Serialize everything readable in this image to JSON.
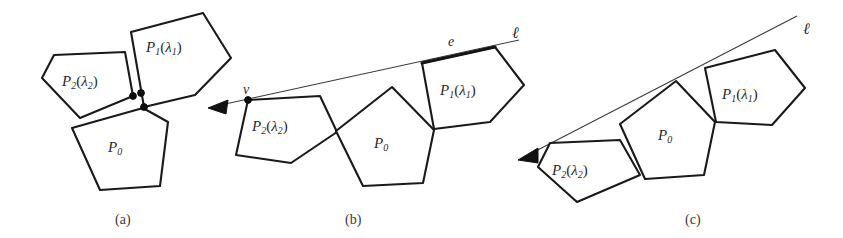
{
  "figure": {
    "width": 843,
    "height": 238,
    "background": "#ffffff",
    "ink_color": "#1a1a1a",
    "line_color": "#3a3a3a",
    "panels": [
      {
        "id": "a",
        "caption": "(a)",
        "caption_pos": [
          115,
          212
        ],
        "has_line": false,
        "polygons": [
          {
            "name": "P2",
            "label": "P",
            "label_sub": "2",
            "label_arg": "λ",
            "label_arg_sub": "2",
            "label_pos": [
              62,
              74
            ],
            "points": "54,55 125,52 133,96 80,118 42,78"
          },
          {
            "name": "P1",
            "label": "P",
            "label_sub": "1",
            "label_arg": "λ",
            "label_arg_sub": "1",
            "label_pos": [
              146,
              40
            ],
            "points": "131,32 203,13 231,58 195,95 144,107"
          },
          {
            "name": "P0",
            "label": "P",
            "label_sub": "0",
            "label_arg": "",
            "label_arg_sub": "",
            "label_pos": [
              108,
              140
            ],
            "points": "143,108 168,122 160,186 100,190 72,128"
          }
        ],
        "dots": [
          [
            133,
            96
          ],
          [
            141,
            93
          ],
          [
            144,
            107
          ]
        ]
      },
      {
        "id": "b",
        "caption": "(b)",
        "caption_pos": [
          345,
          212
        ],
        "has_line": true,
        "line": {
          "from": [
            216,
            106
          ],
          "to": [
            519,
            40
          ],
          "label": "ℓ",
          "label_pos": [
            512,
            24
          ]
        },
        "arrow": {
          "tip": [
            208,
            108
          ],
          "points": "208,108 228,100 226,114"
        },
        "vertex": {
          "label": "v",
          "label_pos": [
            243,
            82
          ],
          "point": [
            248,
            100
          ]
        },
        "edge": {
          "label": "e",
          "label_pos": [
            448,
            34
          ],
          "from": [
            422,
            63
          ],
          "to": [
            495,
            47
          ]
        },
        "polygons": [
          {
            "name": "P2",
            "label": "P",
            "label_sub": "2",
            "label_arg": "λ",
            "label_arg_sub": "2",
            "label_pos": [
              252,
              119
            ],
            "points": "248,100 320,96 337,132 291,163 236,155"
          },
          {
            "name": "P0",
            "label": "P",
            "label_sub": "0",
            "label_arg": "",
            "label_arg_sub": "",
            "label_pos": [
              374,
              136
            ],
            "points": "392,87 434,130 423,183 363,186 336,131"
          },
          {
            "name": "P1",
            "label": "P",
            "label_sub": "1",
            "label_arg": "λ",
            "label_arg_sub": "1",
            "label_pos": [
              440,
              83
            ],
            "points": "422,63 495,47 524,85 490,122 434,129"
          }
        ],
        "dots": [
          [
            248,
            100
          ]
        ]
      },
      {
        "id": "c",
        "caption": "(c)",
        "caption_pos": [
          685,
          212
        ],
        "has_line": true,
        "line": {
          "from": [
            528,
            155
          ],
          "to": [
            797,
            16
          ],
          "label": "ℓ",
          "label_pos": [
            803,
            20
          ]
        },
        "arrow": {
          "tip": [
            518,
            160
          ],
          "points": "518,160 538,148 538,163"
        },
        "polygons": [
          {
            "name": "P2",
            "label": "P",
            "label_sub": "2",
            "label_arg": "λ",
            "label_arg_sub": "2",
            "label_pos": [
              552,
              163
            ],
            "points": "550,143 620,140 640,175 577,202 538,167"
          },
          {
            "name": "P0",
            "label": "P",
            "label_sub": "0",
            "label_arg": "",
            "label_arg_sub": "",
            "label_pos": [
              658,
              128
            ],
            "points": "676,81 715,122 704,175 645,179 620,124"
          },
          {
            "name": "P1",
            "label": "P",
            "label_sub": "1",
            "label_arg": "λ",
            "label_arg_sub": "1",
            "label_pos": [
              722,
              87
            ],
            "points": "705,68 775,50 805,88 772,125 716,122"
          }
        ],
        "dots": []
      }
    ]
  }
}
